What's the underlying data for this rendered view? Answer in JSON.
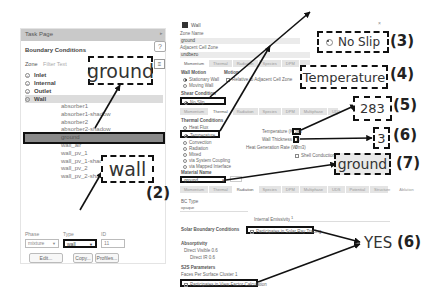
{
  "task_page": {
    "header": "Task Page",
    "title": "Boundary Conditions",
    "help_icon": "question-circle-icon",
    "zone_label": "Zone",
    "zone_filter_placeholder": "Filter Text",
    "filter_icon": "list-filter-icon",
    "categories": [
      {
        "label": "Inlet",
        "expanded": false
      },
      {
        "label": "Internal",
        "expanded": false
      },
      {
        "label": "Outlet",
        "expanded": false
      },
      {
        "label": "Wall",
        "expanded": true
      }
    ],
    "wall_items": [
      "absorber1",
      "absorber1-shadow",
      "absorber2",
      "absorber2-shadow",
      "ground",
      "wall_air",
      "wall_pv_1",
      "wall_pv_1-shadow",
      "wall_pv_2",
      "wall_pv_2-shadow"
    ],
    "selected_item": "ground",
    "phase_label": "Phase",
    "phase_value": "mixture",
    "type_label": "Type",
    "type_value": "wall",
    "id_label": "ID",
    "id_value": "11",
    "edit_button": "Edit...",
    "copy_button": "Copy...",
    "profiles_button": "Profiles..."
  },
  "wall_dialog": {
    "title": "Wall",
    "close": "×",
    "zone_name_label": "Zone Name",
    "zone_name_value": "ground",
    "adjacent_label": "Adjacent Cell Zone",
    "adjacent_value": "undbezo",
    "top_tabs": [
      "Momentum",
      "Thermal",
      "Radiation",
      "Species",
      "DPM",
      "Multiphase"
    ],
    "wall_motion_label": "Wall Motion",
    "motion_label": "Motion",
    "stationary_wall": "Stationary Wall",
    "moving_wall": "Moving Wall",
    "relative_label": "Relative to Adjacent Cell Zone",
    "shear_label": "Shear Condition",
    "no_slip": "No Slip",
    "mid_tabs": [
      "Momentum",
      "Thermal",
      "Radiation",
      "Species",
      "DPM",
      "Multiphase",
      "UDS",
      "Potential"
    ],
    "thermal_conditions_label": "Thermal Conditions",
    "thermal_options": [
      "Heat Flux",
      "Temperature",
      "Convection",
      "Radiation",
      "Mixed",
      "via System Coupling",
      "via Mapped Interface"
    ],
    "selected_thermal": "Temperature",
    "temperature_label": "Temperature (K)",
    "temperature_value": "283",
    "wall_thickness_label": "Wall Thickness (m)",
    "wall_thickness_value": "3",
    "heat_gen_label": "Heat Generation Rate (W/m3)",
    "heat_gen_value": "0",
    "shell_conduction": "Shell Conduction",
    "material_label": "Material Name",
    "material_value": "ground",
    "edit_button": "Edit...",
    "bottom_tabs": [
      "Momentum",
      "Thermal",
      "Radiation",
      "Species",
      "DPM",
      "Multiphase",
      "UDS",
      "Potential",
      "Structure",
      "Ablation"
    ],
    "bc_type_label": "BC Type",
    "bc_type_value": "opaque",
    "internal_emissivity_label": "Internal Emissivity",
    "internal_emissivity_value": "1",
    "solar_bc_label": "Solar Boundary Conditions",
    "solar_ray_tracing": "Participates in Solar Ray Tracing",
    "absorptivity_label": "Absorptivity",
    "direct_visible_label": "Direct Visible",
    "direct_visible_value": "0.6",
    "direct_ir_label": "Direct IR",
    "direct_ir_value": "0.6",
    "s2s_label": "S2S Parameters",
    "faces_per_cluster_label": "Faces Per Surface Cluster",
    "faces_per_cluster_value": "1",
    "view_factor": "Participates in View Factor Calculation"
  },
  "callouts": {
    "ground_zone": "ground",
    "wall_type": "wall",
    "no_slip": "No Slip",
    "temperature": "Temperature",
    "temp_value": "283",
    "thickness_value": "3",
    "material": "ground",
    "yes": "YES",
    "n2": "(2)",
    "n3": "(3)",
    "n4": "(4)",
    "n5": "(5)",
    "n6a": "(6)",
    "n7": "(7)",
    "n6b": "(6)"
  }
}
